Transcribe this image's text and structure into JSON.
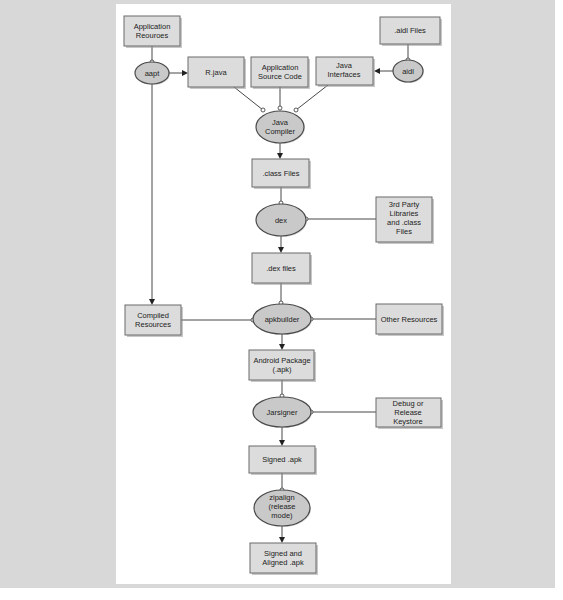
{
  "diagram": {
    "nodes": {
      "app_resources": {
        "kind": "box",
        "lines": [
          "Application",
          "Reouroes"
        ]
      },
      "aapt": {
        "kind": "process",
        "lines": [
          "aapt"
        ]
      },
      "r_java": {
        "kind": "box",
        "lines": [
          "R.java"
        ]
      },
      "app_source": {
        "kind": "box",
        "lines": [
          "Application",
          "Source Code"
        ]
      },
      "java_interfaces": {
        "kind": "box",
        "lines": [
          "Java",
          "Interfaces"
        ]
      },
      "aidl_files": {
        "kind": "box",
        "lines": [
          ".aidl Files"
        ]
      },
      "aidl": {
        "kind": "process",
        "lines": [
          "aidl"
        ]
      },
      "java_compiler": {
        "kind": "process",
        "lines": [
          "Java",
          "Compiler"
        ]
      },
      "class_files": {
        "kind": "box",
        "lines": [
          ".class Files"
        ]
      },
      "dex": {
        "kind": "process",
        "lines": [
          "dex"
        ]
      },
      "third_party": {
        "kind": "box",
        "lines": [
          "3rd Party",
          "Libraries",
          "and .class",
          "Files"
        ]
      },
      "dex_files": {
        "kind": "box",
        "lines": [
          ".dex files"
        ]
      },
      "compiled_resources": {
        "kind": "box",
        "lines": [
          "Compiled",
          "Resources"
        ]
      },
      "apkbuilder": {
        "kind": "process",
        "lines": [
          "apkbuilder"
        ]
      },
      "other_resources": {
        "kind": "box",
        "lines": [
          "Other Resources"
        ]
      },
      "android_package": {
        "kind": "box",
        "lines": [
          "Android Package",
          "(.apk)"
        ]
      },
      "jarsigner": {
        "kind": "process",
        "lines": [
          "Jarsigner"
        ]
      },
      "keystore": {
        "kind": "box",
        "lines": [
          "Debug or",
          "Release",
          "Keystore"
        ]
      },
      "signed_apk": {
        "kind": "box",
        "lines": [
          "Signed .apk"
        ]
      },
      "zipalign": {
        "kind": "process",
        "lines": [
          "zipalign",
          "(release",
          "mode)"
        ]
      },
      "signed_aligned_apk": {
        "kind": "box",
        "lines": [
          "Signed and",
          "Aligned .apk"
        ]
      }
    },
    "edges": [
      {
        "from": "app_resources",
        "to": "aapt"
      },
      {
        "from": "aapt",
        "to": "r_java"
      },
      {
        "from": "aapt",
        "to": "compiled_resources"
      },
      {
        "from": "aidl_files",
        "to": "aidl"
      },
      {
        "from": "aidl",
        "to": "java_interfaces"
      },
      {
        "from": "r_java",
        "to": "java_compiler"
      },
      {
        "from": "app_source",
        "to": "java_compiler"
      },
      {
        "from": "java_interfaces",
        "to": "java_compiler"
      },
      {
        "from": "java_compiler",
        "to": "class_files"
      },
      {
        "from": "class_files",
        "to": "dex"
      },
      {
        "from": "third_party",
        "to": "dex"
      },
      {
        "from": "dex",
        "to": "dex_files"
      },
      {
        "from": "dex_files",
        "to": "apkbuilder"
      },
      {
        "from": "compiled_resources",
        "to": "apkbuilder"
      },
      {
        "from": "other_resources",
        "to": "apkbuilder"
      },
      {
        "from": "apkbuilder",
        "to": "android_package"
      },
      {
        "from": "android_package",
        "to": "jarsigner"
      },
      {
        "from": "keystore",
        "to": "jarsigner"
      },
      {
        "from": "jarsigner",
        "to": "signed_apk"
      },
      {
        "from": "signed_apk",
        "to": "zipalign"
      },
      {
        "from": "zipalign",
        "to": "signed_aligned_apk"
      }
    ]
  },
  "colors": {
    "backdrop": "#d8d8d8",
    "panel": "#ffffff",
    "box_fill": "#dcdcdc",
    "process_fill": "#c9c9c9",
    "stroke": "#333333"
  }
}
